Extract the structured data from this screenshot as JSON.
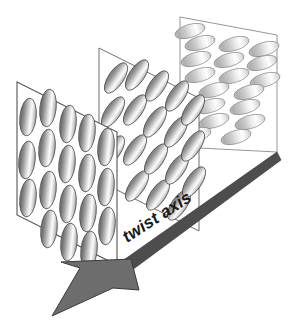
{
  "figure": {
    "background_color": "#ffffff",
    "width": 294,
    "height": 330
  },
  "axis": {
    "label": "twist axis",
    "label_rotation_deg": -33,
    "band_color": "#4d4d4d",
    "band_outline_color": "#2f2f2f",
    "head_color": "#6d6d6d",
    "head_outline_color": "#3a3a3a",
    "direction": "down-left",
    "tail_point": [
      277,
      155
    ],
    "tip_point": [
      52,
      316
    ]
  },
  "planes": [
    {
      "name": "front-plane",
      "order": 1,
      "outline_color": "#555555",
      "rod_tilt_deg": -8,
      "rod_fill_light": "#fdfdfd",
      "rod_fill_dark": "#6f6f6f",
      "rod_count": 18,
      "corners": [
        [
          17,
          82
        ],
        [
          117,
          132
        ],
        [
          117,
          265
        ],
        [
          17,
          215
        ]
      ]
    },
    {
      "name": "middle-plane",
      "order": 2,
      "outline_color": "#6e6e6e",
      "rod_tilt_deg": -36,
      "rod_fill_light": "#fbfbfb",
      "rod_fill_dark": "#808080",
      "rod_count": 18,
      "corners": [
        [
          99,
          48
        ],
        [
          199,
          98
        ],
        [
          199,
          231
        ],
        [
          99,
          181
        ]
      ]
    },
    {
      "name": "back-plane",
      "order": 3,
      "outline_color": "#8a8a8a",
      "rod_tilt_deg": -74,
      "rod_fill_light": "#fefefe",
      "rod_fill_dark": "#aeaeae",
      "rod_count": 18,
      "corners": [
        [
          180,
          17
        ],
        [
          277,
          35
        ],
        [
          277,
          152
        ],
        [
          180,
          147
        ]
      ]
    }
  ],
  "legend": {
    "caption": "twist axis"
  }
}
